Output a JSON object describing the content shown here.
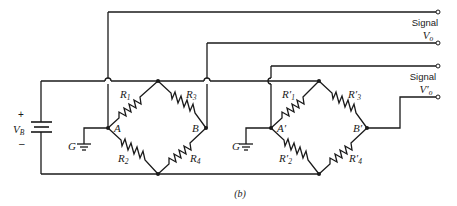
{
  "diagram": {
    "type": "dual wheatstone bridge circuit",
    "caption": "(b)",
    "battery": {
      "label": "V",
      "sub": "B",
      "plus": "+",
      "minus": "–"
    },
    "bridge1": {
      "ground_label": "G",
      "nodes": {
        "left": "A",
        "right": "B"
      },
      "resistors": [
        {
          "label": "R",
          "sub": "1"
        },
        {
          "label": "R",
          "sub": "3"
        },
        {
          "label": "R",
          "sub": "2"
        },
        {
          "label": "R",
          "sub": "4"
        }
      ]
    },
    "bridge2": {
      "ground_label": "G",
      "nodes": {
        "left": "A′",
        "right": "B′"
      },
      "resistors": [
        {
          "label": "R′",
          "sub": "1"
        },
        {
          "label": "R′",
          "sub": "3"
        },
        {
          "label": "R′",
          "sub": "2"
        },
        {
          "label": "R′",
          "sub": "4"
        }
      ]
    },
    "outputs": [
      {
        "title": "Signal",
        "label": "V",
        "sub": "o"
      },
      {
        "title": "Signal",
        "label": "V′",
        "sub": "o"
      }
    ]
  }
}
